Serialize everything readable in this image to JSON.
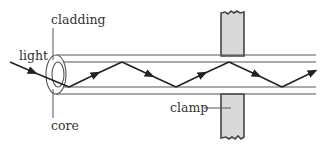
{
  "diagram": {
    "labels": {
      "cladding": "cladding",
      "light": "light",
      "core": "core",
      "clamp": "clamp"
    },
    "colors": {
      "line": "#555555",
      "ray": "#222222",
      "clamp_fill": "#d9d9d9",
      "clamp_stroke": "#444444",
      "background": "#ffffff"
    }
  }
}
